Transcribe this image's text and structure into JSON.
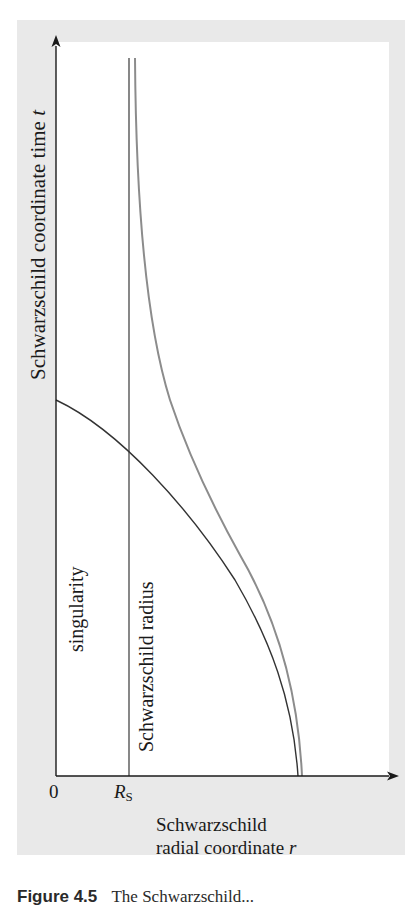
{
  "figure": {
    "type": "spacetime-diagram",
    "y_axis": {
      "label": "Schwarzschild coordinate time",
      "variable": "t"
    },
    "x_axis": {
      "label_line1": "Schwarzschild",
      "label_line2": "radial coordinate",
      "variable": "r",
      "ticks": [
        {
          "label": "0",
          "position": "origin"
        },
        {
          "label": "R",
          "subscript": "S",
          "position": "schwarzschild_radius"
        }
      ]
    },
    "annotations": {
      "singularity": "singularity",
      "schwarzschild_radius": "Schwarzschild radius"
    },
    "curves": [
      {
        "name": "schwarzschild-radius-line",
        "description": "vertical line at r = R_S",
        "color": "#555555"
      },
      {
        "name": "infalling-proper-trajectory",
        "description": "curve from r far out at t=0 crossing R_S and reaching r=0 at finite t",
        "color": "#333333"
      },
      {
        "name": "coordinate-time-trajectory",
        "description": "curve from r far out at t=0 asymptotically approaching R_S as t → ∞",
        "color": "#8c8c8c"
      }
    ],
    "colors": {
      "panel_background": "#e9e9e9",
      "plot_background": "#ffffff",
      "axis": "#1a1a1a"
    }
  },
  "caption": {
    "number": "Figure 4.5",
    "text": "The Schwarzschild..."
  }
}
